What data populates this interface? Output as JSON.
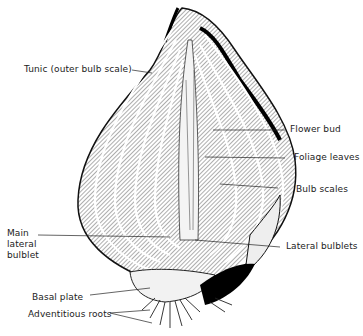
{
  "figure": {
    "labels": [
      {
        "id": "tunic",
        "text": "Tunic (outer bulb scale)"
      },
      {
        "id": "flower-bud",
        "text": "Flower bud"
      },
      {
        "id": "foliage-leaves",
        "text": "Foliage leaves"
      },
      {
        "id": "bulb-scales",
        "text": "Bulb scales"
      },
      {
        "id": "main-lateral-bulblet",
        "text": "Main\nlateral\nbulblet"
      },
      {
        "id": "lateral-bulblets",
        "text": "Lateral bulblets"
      },
      {
        "id": "basal-plate",
        "text": "Basal plate"
      },
      {
        "id": "adventitious-roots",
        "text": "Adventitious roots"
      }
    ]
  }
}
